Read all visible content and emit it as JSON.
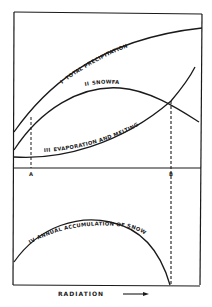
{
  "diagram": {
    "colors": {
      "ink": "#1a1a1a",
      "background": "#ffffff"
    },
    "upper_panel": {
      "curves": [
        {
          "numeral": "I",
          "label": "TOTAL PRECIPITATION"
        },
        {
          "numeral": "II",
          "label": "SNOWFALL"
        },
        {
          "numeral": "III",
          "label": "EVAPORATION AND MELTING"
        }
      ],
      "points": {
        "a": "A",
        "b": "B"
      }
    },
    "lower_panel": {
      "curve": {
        "numeral": "IV",
        "label": "ANNUAL ACCUMULATION OF SNOW"
      }
    },
    "x_axis": {
      "label": "RADIATION",
      "arrow": "right-arrow"
    }
  }
}
